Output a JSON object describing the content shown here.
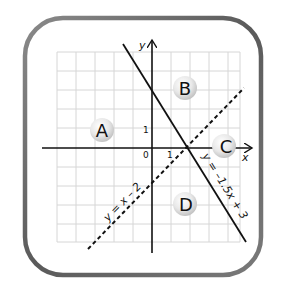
{
  "diagram": {
    "axes": {
      "x_label": "x",
      "y_label": "y",
      "origin_label": "0",
      "x_tick_label": "1",
      "y_tick_label": "1"
    },
    "lines": [
      {
        "equation": "y = x – 2",
        "style": "dashed"
      },
      {
        "equation": "y = –1.5x + 3",
        "style": "solid"
      }
    ],
    "regions": [
      {
        "id": "A",
        "label": "A"
      },
      {
        "id": "B",
        "label": "B"
      },
      {
        "id": "C",
        "label": "C"
      },
      {
        "id": "D",
        "label": "D"
      }
    ],
    "colors": {
      "frame": "#6b6b6b",
      "grid": "#d4d4d4",
      "axis": "#111111",
      "badge": "#e6e6e6"
    }
  }
}
